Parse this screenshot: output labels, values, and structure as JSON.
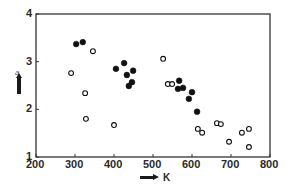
{
  "chart_data": {
    "type": "scatter",
    "title": "",
    "xlabel": "K",
    "ylabel": "a",
    "xlim": [
      200,
      800
    ],
    "ylim": [
      1,
      4
    ],
    "x_ticks": [
      200,
      300,
      400,
      500,
      600,
      700,
      800
    ],
    "y_ticks": [
      1,
      2,
      3,
      4
    ],
    "grid": false,
    "legend": null,
    "series": [
      {
        "name": "filled",
        "marker": "filled-circle",
        "color": "#111111",
        "points": [
          [
            303,
            3.37
          ],
          [
            320,
            3.41
          ],
          [
            405,
            2.85
          ],
          [
            426,
            2.97
          ],
          [
            433,
            2.72
          ],
          [
            449,
            2.81
          ],
          [
            446,
            2.57
          ],
          [
            438,
            2.49
          ],
          [
            567,
            2.6
          ],
          [
            564,
            2.43
          ],
          [
            577,
            2.45
          ],
          [
            600,
            2.36
          ],
          [
            592,
            2.22
          ],
          [
            613,
            1.95
          ]
        ]
      },
      {
        "name": "open",
        "marker": "open-circle",
        "color": "#111111",
        "points": [
          [
            290,
            2.76
          ],
          [
            346,
            3.22
          ],
          [
            326,
            2.34
          ],
          [
            328,
            1.8
          ],
          [
            400,
            1.67
          ],
          [
            526,
            3.06
          ],
          [
            538,
            2.53
          ],
          [
            549,
            2.53
          ],
          [
            615,
            1.59
          ],
          [
            626,
            1.51
          ],
          [
            664,
            1.71
          ],
          [
            674,
            1.69
          ],
          [
            695,
            1.32
          ],
          [
            728,
            1.51
          ],
          [
            746,
            1.59
          ],
          [
            746,
            1.21
          ]
        ]
      }
    ]
  },
  "labels": {
    "x_axis": "K",
    "y_axis": "a",
    "x_ticks": [
      "200",
      "300",
      "400",
      "500",
      "600",
      "700",
      "800"
    ],
    "y_ticks": [
      "1",
      "2",
      "3",
      "4"
    ]
  }
}
